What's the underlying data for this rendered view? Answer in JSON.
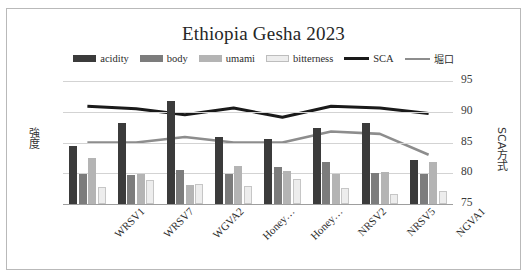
{
  "top_strip_text": "",
  "chart_data": {
    "type": "bar",
    "title": "Ethiopia Gesha 2023",
    "xlabel": "",
    "ylabel": "強度",
    "y2label": "SCA方式",
    "ylim": [
      0,
      2
    ],
    "y2lim": [
      75,
      95
    ],
    "yticks": [
      "0",
      "0.5",
      "1",
      "1.5",
      "2"
    ],
    "y2ticks": [
      "75",
      "80",
      "85",
      "90",
      "95"
    ],
    "grid": true,
    "legend_position": "top",
    "categories": [
      "WRSV1",
      "WRSV7",
      "WGVA2",
      "Honey…",
      "Honey…",
      "NRSV2",
      "NRSV5",
      "NGVA1"
    ],
    "series": [
      {
        "name": "acidity",
        "type": "bar",
        "axis": "left",
        "color": "#3b3b3b",
        "values": [
          0.95,
          1.32,
          1.67,
          1.09,
          1.05,
          1.23,
          1.31,
          0.72
        ]
      },
      {
        "name": "body",
        "type": "bar",
        "axis": "left",
        "color": "#7c7c7c",
        "values": [
          0.49,
          0.47,
          0.56,
          0.48,
          0.6,
          0.68,
          0.51,
          0.48
        ]
      },
      {
        "name": "umami",
        "type": "bar",
        "axis": "left",
        "color": "#b4b4b4",
        "values": [
          0.75,
          0.48,
          0.31,
          0.62,
          0.54,
          0.49,
          0.52,
          0.69
        ]
      },
      {
        "name": "bitterness",
        "type": "bar",
        "axis": "left",
        "color": "#ededed",
        "values": [
          0.27,
          0.39,
          0.32,
          0.3,
          0.41,
          0.26,
          0.17,
          0.21
        ]
      },
      {
        "name": "SCA",
        "type": "line",
        "axis": "right",
        "color": "#1a1a1a",
        "values": [
          90.9,
          90.5,
          89.5,
          90.6,
          89.1,
          90.9,
          90.6,
          89.7
        ]
      },
      {
        "name": "堀口",
        "type": "line",
        "axis": "right",
        "color": "#8d8d8d",
        "values": [
          85.0,
          85.0,
          85.9,
          85.0,
          85.0,
          86.8,
          86.4,
          83.0
        ]
      }
    ]
  },
  "legend": {
    "items": [
      {
        "label": "acidity",
        "marker": "swatch",
        "color": "#3b3b3b",
        "outlined": false
      },
      {
        "label": "body",
        "marker": "swatch",
        "color": "#7c7c7c",
        "outlined": false
      },
      {
        "label": "umami",
        "marker": "swatch",
        "color": "#b4b4b4",
        "outlined": false
      },
      {
        "label": "bitterness",
        "marker": "swatch",
        "color": "#ededed",
        "outlined": true
      },
      {
        "label": "SCA",
        "marker": "line",
        "color": "#1a1a1a",
        "outlined": false
      },
      {
        "label": "堀口",
        "marker": "line",
        "color": "#8d8d8d",
        "outlined": false
      }
    ]
  }
}
